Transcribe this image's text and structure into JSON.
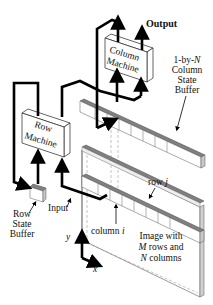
{
  "diagram": {
    "type": "architecture-schematic",
    "components": {
      "column_machine": {
        "line1": "Column",
        "line2": "Machine"
      },
      "row_machine": {
        "line1": "Row",
        "line2": "Machine"
      },
      "column_state_buffer": {
        "line1": "1-by-",
        "line1_var": "N",
        "line2": "Column",
        "line3": "State",
        "line4": "Buffer"
      },
      "row_state_buffer": {
        "line1": "Row",
        "line2": "State",
        "line3": "Buffer"
      },
      "image": {
        "line1": "Image with",
        "line2_var": "M",
        "line2": " rows and",
        "line3_var": "N",
        "line3": " columns"
      }
    },
    "labels": {
      "output": "Output",
      "input": "Input",
      "row_j": "row ",
      "row_j_var": "j",
      "column_i": "column ",
      "column_i_var": "i",
      "axis_y": "y",
      "axis_x": "x"
    },
    "colors": {
      "line": "#000000",
      "bar_top": "#808080",
      "bar_side": "#c8c8c8",
      "box_fill": "#ffffff",
      "dashed": "#9a9a9a"
    }
  }
}
